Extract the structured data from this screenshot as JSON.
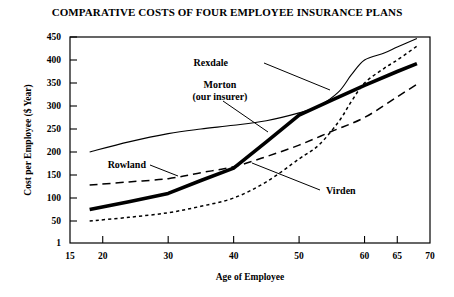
{
  "chart_data": {
    "type": "line",
    "title": "COMPARATIVE COSTS OF FOUR EMPLOYEE INSURANCE PLANS",
    "xlabel": "Age of Employee",
    "ylabel": "Cost per Employee ($ Year)",
    "xlim": [
      15,
      70
    ],
    "ylim": [
      1,
      450
    ],
    "xticks": [
      "15",
      "20",
      "30",
      "40",
      "50",
      "60",
      "65",
      "70"
    ],
    "xtick_values": [
      15,
      20,
      30,
      40,
      50,
      60,
      65,
      70
    ],
    "yticks": [
      "1",
      "50",
      "100",
      "150",
      "200",
      "250",
      "300",
      "350",
      "400",
      "450"
    ],
    "ytick_values": [
      1,
      50,
      100,
      150,
      200,
      250,
      300,
      350,
      400,
      450
    ],
    "grid": false,
    "legend": "inline-labels-with-leader-lines",
    "series": [
      {
        "name": "Rexdale",
        "style": "thin-solid",
        "x": [
          18,
          24,
          30,
          35,
          40,
          45,
          50,
          53,
          56,
          58,
          60,
          63,
          65,
          68
        ],
        "values": [
          200,
          222,
          240,
          250,
          258,
          268,
          285,
          300,
          330,
          368,
          400,
          415,
          428,
          447
        ]
      },
      {
        "name": "Morton (our insurer)",
        "style": "thick-solid",
        "x": [
          18,
          24,
          30,
          35,
          40,
          45,
          50,
          55,
          60,
          65,
          68
        ],
        "values": [
          75,
          92,
          110,
          138,
          165,
          222,
          280,
          313,
          345,
          375,
          392
        ]
      },
      {
        "name": "Rowland",
        "style": "long-dash",
        "x": [
          18,
          24,
          30,
          35,
          40,
          45,
          50,
          55,
          60,
          65,
          68
        ],
        "values": [
          128,
          135,
          142,
          155,
          168,
          190,
          215,
          245,
          275,
          320,
          347
        ]
      },
      {
        "name": "Virden",
        "style": "fine-dot",
        "x": [
          18,
          24,
          30,
          35,
          40,
          45,
          50,
          53,
          56,
          58,
          60,
          63,
          65,
          68
        ],
        "values": [
          50,
          58,
          68,
          82,
          100,
          135,
          185,
          215,
          265,
          310,
          350,
          382,
          400,
          430
        ]
      }
    ],
    "annotations": [
      {
        "name": "Rexdale",
        "label": "Rexdale"
      },
      {
        "name": "Morton",
        "label_line1": "Morton",
        "label_line2": "(our insurer)"
      },
      {
        "name": "Rowland",
        "label": "Rowland"
      },
      {
        "name": "Virden",
        "label": "Virden"
      }
    ]
  },
  "colors": {
    "ink": "#000000",
    "background": "#ffffff"
  }
}
